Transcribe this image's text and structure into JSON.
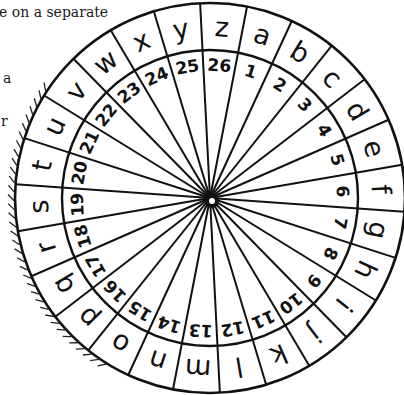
{
  "text_fragments": {
    "line1": "e on a separate",
    "line2": "a",
    "line3": "r"
  },
  "wheel": {
    "title": "cipher wheel",
    "segments": 26,
    "outer_ring_letters": [
      "z",
      "a",
      "b",
      "c",
      "d",
      "e",
      "f",
      "g",
      "h",
      "i",
      "j",
      "k",
      "l",
      "m",
      "n",
      "o",
      "p",
      "q",
      "r",
      "s",
      "t",
      "u",
      "v",
      "w",
      "x",
      "y"
    ],
    "inner_ring_numbers": [
      "26",
      "1",
      "2",
      "3",
      "4",
      "5",
      "6",
      "7",
      "8",
      "9",
      "10",
      "11",
      "12",
      "13",
      "14",
      "15",
      "16",
      "17",
      "18",
      "19",
      "20",
      "21",
      "22",
      "23",
      "24",
      "25"
    ],
    "ink_color": "#111111",
    "background_color": "#ffffff"
  }
}
